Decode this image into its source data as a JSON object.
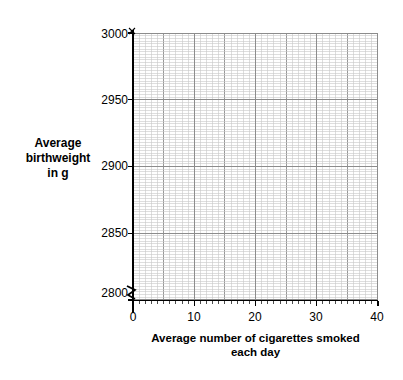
{
  "chart_data": {
    "type": "scatter",
    "title": "",
    "subtitle": "",
    "xlabel": "Average number of cigarettes smoked each day",
    "xlabel_lines": [
      "Average number of cigarettes smoked",
      "each day"
    ],
    "ylabel": "Average birthweight in g",
    "ylabel_lines": [
      "Average",
      "birthweight",
      "in g"
    ],
    "xlim": [
      0,
      40
    ],
    "ylim": [
      2800,
      3000
    ],
    "xticks": [
      0,
      10,
      20,
      30,
      40
    ],
    "xtick_labels": [
      "0",
      "10",
      "20",
      "30",
      "40"
    ],
    "yticks": [
      2800,
      2850,
      2900,
      2950,
      3000
    ],
    "ytick_labels": [
      "2800",
      "2850",
      "2900",
      "2950",
      "3000"
    ],
    "x_minor_step": 1,
    "y_minor_step": 2,
    "x_major_step": 10,
    "y_major_step": 50,
    "grid": true,
    "grid_minor": true,
    "legend": false,
    "legend_position": "none",
    "y_axis_break": true,
    "y_axis_break_note": "zigzag break symbol on y-axis below 2800",
    "series": [
      {
        "name": "",
        "x": [],
        "y": []
      }
    ],
    "annotations": []
  },
  "axis_labels": {
    "y_line1": "Average",
    "y_line2": "birthweight",
    "y_line3": "in g",
    "x_line1": "Average number of cigarettes smoked",
    "x_line2": "each day"
  },
  "ticks": {
    "y": [
      "3000",
      "2950",
      "2900",
      "2850",
      "2800"
    ],
    "x": [
      "0",
      "10",
      "20",
      "30",
      "40"
    ]
  },
  "colors": {
    "background": "#ffffff",
    "axis": "#000000",
    "grid_minor": "#c8c8c8",
    "grid_major": "#8c8c8c",
    "text": "#000000"
  }
}
